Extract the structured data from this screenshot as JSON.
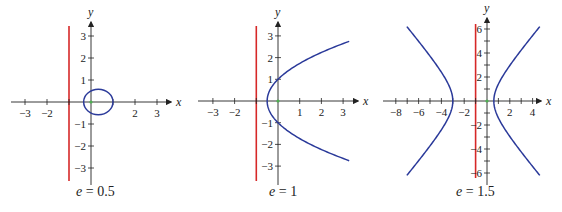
{
  "chart_data": [
    {
      "type": "line",
      "title": "e = 0.5",
      "caption_var": "e",
      "caption_value": "0.5",
      "conic": "ellipse",
      "xlabel": "x",
      "ylabel": "y",
      "xlim": [
        -3.5,
        3.5
      ],
      "ylim": [
        -3.5,
        3.5
      ],
      "xticks": [
        -3,
        -2,
        2,
        3
      ],
      "yticks": [
        3,
        2,
        1,
        -1,
        -2,
        -3
      ],
      "directrix_x": -1,
      "ellipse": {
        "center": [
          0.333,
          0
        ],
        "a": 0.667,
        "b": 0.577
      },
      "colors": {
        "curve": "#2b3a9a",
        "directrix": "#d62828",
        "axis": "#222222"
      },
      "grid": false
    },
    {
      "type": "line",
      "title": "e = 1",
      "caption_var": "e",
      "caption_value": "1",
      "conic": "parabola",
      "xlabel": "x",
      "ylabel": "y",
      "xlim": [
        -3.5,
        3.5
      ],
      "ylim": [
        -3.5,
        3.5
      ],
      "xticks": [
        -3,
        -2,
        1,
        2,
        3
      ],
      "yticks": [
        3,
        2,
        1,
        -1,
        -2,
        -3
      ],
      "directrix_x": -1,
      "parabola": {
        "vertex": [
          -0.5,
          0
        ],
        "p": 1,
        "y_range": [
          -2.75,
          2.75
        ]
      },
      "colors": {
        "curve": "#2b3a9a",
        "directrix": "#d62828",
        "axis": "#222222"
      },
      "grid": false
    },
    {
      "type": "line",
      "title": "e = 1.5",
      "caption_var": "e",
      "caption_value": "1.5",
      "conic": "hyperbola",
      "xlabel": "x",
      "ylabel": "y",
      "xlim": [
        -8.5,
        4.5
      ],
      "ylim": [
        -6.5,
        6.5
      ],
      "xticks": [
        -8,
        -6,
        -4,
        -2,
        2,
        4
      ],
      "yticks": [
        6,
        4,
        2,
        -2,
        -4,
        -6
      ],
      "directrix_x": -1,
      "hyperbola": {
        "center": [
          -1.2,
          0
        ],
        "a": 1.8,
        "b": 2.012,
        "vertices": [
          -3,
          0.6
        ],
        "y_range": [
          -6.2,
          6.2
        ]
      },
      "colors": {
        "curve": "#2b3a9a",
        "directrix": "#d62828",
        "axis": "#222222"
      },
      "grid": false
    }
  ]
}
